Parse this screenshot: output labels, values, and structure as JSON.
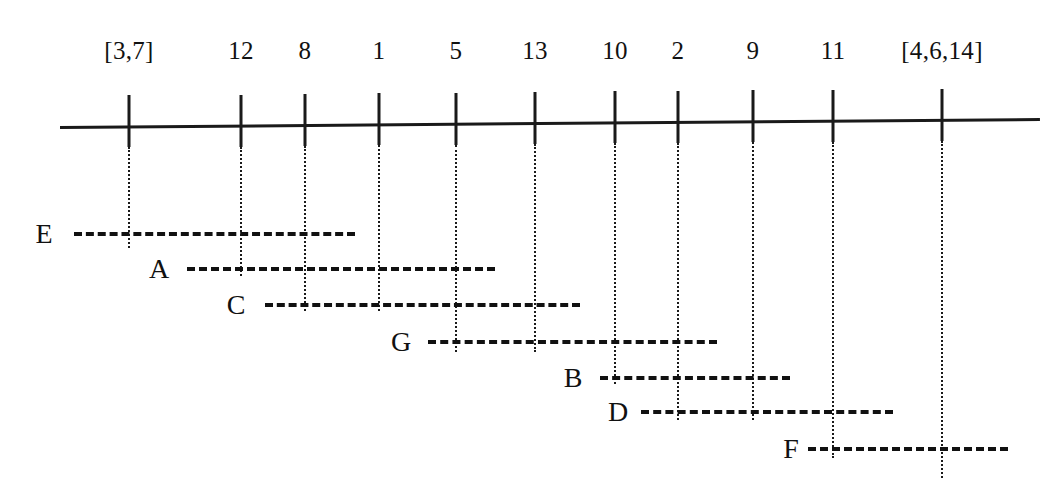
{
  "figure": {
    "type": "interval-schedule-diagram",
    "background_color": "#ffffff",
    "ink_color": "#111111"
  },
  "axis": {
    "name": "timeline-axis",
    "x_start": 60,
    "x_end": 1040,
    "y_left": 126,
    "y_right": 118,
    "tick_top": 96,
    "tick_bottom": 148
  },
  "ticks": [
    {
      "label": "[3,7]",
      "x": 129,
      "guide_bottom": 248
    },
    {
      "label": "12",
      "x": 241,
      "guide_bottom": 276
    },
    {
      "label": "8",
      "x": 305,
      "guide_bottom": 311
    },
    {
      "label": "1",
      "x": 379,
      "guide_bottom": 311
    },
    {
      "label": "5",
      "x": 456,
      "guide_bottom": 352
    },
    {
      "label": "13",
      "x": 535,
      "guide_bottom": 352
    },
    {
      "label": "10",
      "x": 615,
      "guide_bottom": 384
    },
    {
      "label": "2",
      "x": 678,
      "guide_bottom": 420
    },
    {
      "label": "9",
      "x": 753,
      "guide_bottom": 420
    },
    {
      "label": "11",
      "x": 833,
      "guide_bottom": 458
    },
    {
      "label": "[4,6,14]",
      "x": 942,
      "guide_bottom": 478
    }
  ],
  "tick_label_y": 38,
  "intervals": [
    {
      "id": "E",
      "label": "E",
      "label_x": 44,
      "y": 234,
      "bar_start": 74,
      "bar_end": 355
    },
    {
      "id": "A",
      "label": "A",
      "label_x": 159,
      "y": 269,
      "bar_start": 187,
      "bar_end": 495
    },
    {
      "id": "C",
      "label": "C",
      "label_x": 236,
      "y": 305,
      "bar_start": 265,
      "bar_end": 580
    },
    {
      "id": "G",
      "label": "G",
      "label_x": 401,
      "y": 342,
      "bar_start": 428,
      "bar_end": 717
    },
    {
      "id": "B",
      "label": "B",
      "label_x": 573,
      "y": 378,
      "bar_start": 600,
      "bar_end": 790
    },
    {
      "id": "D",
      "label": "D",
      "label_x": 618,
      "y": 412,
      "bar_start": 641,
      "bar_end": 893
    },
    {
      "id": "F",
      "label": "F",
      "label_x": 791,
      "y": 449,
      "bar_start": 808,
      "bar_end": 1008
    }
  ],
  "chart_data": {
    "type": "table",
    "title": "",
    "xlabel": "",
    "ylabel": "",
    "categories": [
      "E",
      "A",
      "C",
      "G",
      "B",
      "D",
      "F"
    ],
    "tick_labels": [
      "[3,7]",
      "12",
      "8",
      "1",
      "5",
      "13",
      "10",
      "2",
      "9",
      "11",
      "[4,6,14]"
    ],
    "series": [
      {
        "name": "E",
        "start_tick": "[3,7]",
        "end_tick": "8"
      },
      {
        "name": "A",
        "start_tick": "12",
        "end_tick": "5"
      },
      {
        "name": "C",
        "start_tick": "8",
        "end_tick": "13"
      },
      {
        "name": "G",
        "start_tick": "5",
        "end_tick": "2"
      },
      {
        "name": "B",
        "start_tick": "10",
        "end_tick": "9"
      },
      {
        "name": "D",
        "start_tick": "2",
        "end_tick": "11"
      },
      {
        "name": "F",
        "start_tick": "11",
        "end_tick": "[4,6,14]"
      }
    ]
  }
}
